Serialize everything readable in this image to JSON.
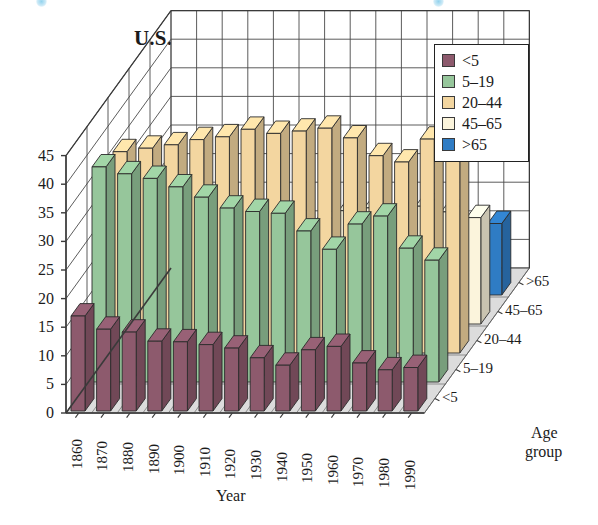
{
  "chart_data": {
    "type": "bar",
    "title": "U.S. Age Groups",
    "xlabel": "Year",
    "zlabel": "Age group",
    "ylabel": "",
    "ylim": [
      0,
      45
    ],
    "yticks": [
      0,
      5,
      10,
      15,
      20,
      25,
      30,
      35,
      40,
      45
    ],
    "grid": true,
    "projection": "3d",
    "legend_position": "top-right",
    "categories": [
      "1860",
      "1870",
      "1880",
      "1890",
      "1900",
      "1910",
      "1920",
      "1930",
      "1940",
      "1950",
      "1960",
      "1970",
      "1980",
      "1990"
    ],
    "depth_categories": [
      "<5",
      "5–19",
      "20–44",
      "45–65",
      ">65"
    ],
    "series": [
      {
        "name": "<5",
        "color": "#8d5a6d",
        "values": [
          16.6,
          14.3,
          13.8,
          12.2,
          12.1,
          11.6,
          11.0,
          9.3,
          8.0,
          10.7,
          11.3,
          8.4,
          7.2,
          7.6
        ]
      },
      {
        "name": "5–19",
        "color": "#96c69b",
        "values": [
          37.6,
          36.4,
          35.6,
          34.1,
          32.3,
          30.4,
          29.8,
          29.5,
          26.4,
          23.2,
          27.6,
          29.0,
          23.4,
          21.3
        ]
      },
      {
        "name": "20–44",
        "color": "#f3d6a0",
        "values": [
          35.2,
          35.8,
          36.4,
          37.3,
          37.8,
          39.1,
          38.4,
          38.8,
          39.3,
          37.6,
          34.5,
          33.4,
          37.4,
          40.0
        ]
      },
      {
        "name": "45–65",
        "color": "#fbf4dc",
        "values": [
          8.0,
          9.9,
          10.4,
          11.8,
          13.1,
          14.6,
          16.1,
          17.5,
          19.8,
          20.3,
          20.1,
          20.6,
          19.6,
          18.6
        ]
      },
      {
        "name": ">65",
        "color": "#2f7cc4",
        "values": [
          2.6,
          3.0,
          3.4,
          3.9,
          4.1,
          4.3,
          4.7,
          5.4,
          6.8,
          8.1,
          9.2,
          9.8,
          11.3,
          12.5
        ]
      }
    ]
  },
  "legend": {
    "items": [
      {
        "label": "<5",
        "color": "#8d5a6d"
      },
      {
        "label": "5–19",
        "color": "#96c69b"
      },
      {
        "label": "20–44",
        "color": "#f3d6a0"
      },
      {
        "label": "45–65",
        "color": "#fbf4dc"
      },
      {
        "label": ">65",
        "color": "#2f7cc4"
      }
    ]
  },
  "axes": {
    "y_ticks": [
      "45",
      "40",
      "35",
      "30",
      "25",
      "20",
      "15",
      "10",
      "5",
      "0"
    ],
    "x_title": "Year",
    "z_title_line1": "Age",
    "z_title_line2": "group"
  }
}
